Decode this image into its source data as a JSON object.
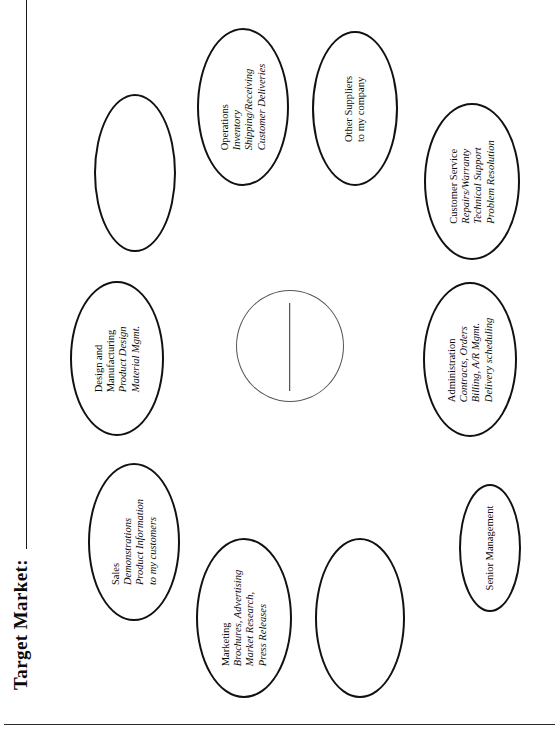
{
  "document": {
    "title": "Target Market:",
    "orientation": "rotated-90-ccw"
  },
  "diagram": {
    "type": "hub-and-spoke-ellipse-map",
    "center": {
      "name": "center-blank-circle",
      "label": "",
      "has_write_in_line": true
    },
    "nodes": [
      {
        "id": "blank-top-left",
        "head": "",
        "sub": []
      },
      {
        "id": "operations",
        "head": "Operations",
        "sub": [
          "Inventory",
          "Shipping/Receiving",
          "Customer Deliveries"
        ]
      },
      {
        "id": "other-suppliers",
        "head": "Other Suppliers",
        "sub": [
          "to my company"
        ]
      },
      {
        "id": "customer-service",
        "head": "Customer Service",
        "sub": [
          "Repairs/Warranty",
          "Technical Support",
          "Problem Resolution"
        ]
      },
      {
        "id": "design-and-manufacturing",
        "head": "Design and\nManufacturing",
        "sub": [
          "Product Design",
          "Material Mgmt."
        ]
      },
      {
        "id": "administration",
        "head": "Administration",
        "sub": [
          "Contracts, Orders",
          "Billing, A/R Mgmt.",
          "Delivery scheduling"
        ]
      },
      {
        "id": "sales",
        "head": "Sales",
        "sub": [
          "Demonstrations",
          "Product Information",
          "to my customers"
        ]
      },
      {
        "id": "marketing",
        "head": "Marketing",
        "sub": [
          "Brochures, Advertising",
          "Market Research,",
          "Press Releases"
        ]
      },
      {
        "id": "blank-bottom-middle",
        "head": "",
        "sub": []
      },
      {
        "id": "senior-management",
        "head": "Senior Management",
        "sub": []
      }
    ]
  },
  "colors": {
    "ink": "#111111",
    "paper": "#ffffff",
    "rule": "#2b2b2b"
  }
}
